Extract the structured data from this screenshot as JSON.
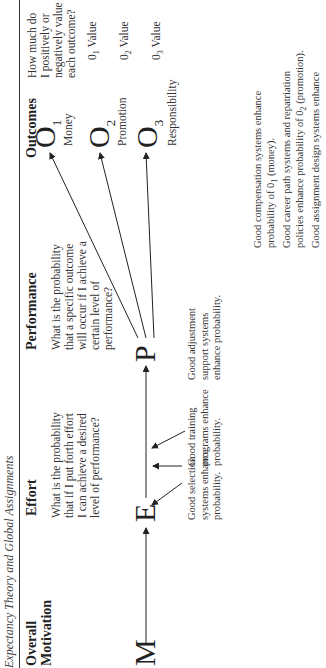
{
  "caption": "Expectancy Theory and Global Assignments",
  "columns": {
    "motivation": "Overall\nMotivation",
    "effort": "Effort",
    "performance": "Performance",
    "outcomes": "Outcomes"
  },
  "questions": {
    "effort": [
      "What is the probability",
      "that if I put forth effort",
      "I can achieve a desired",
      "level of performance?"
    ],
    "performance": [
      "What is the probability",
      "that a specific outcome",
      "will occur if I achieve a",
      "certain level of",
      "performance?"
    ],
    "outcomes": [
      "How much do",
      "I positively or",
      "negatively value",
      "each outcome?"
    ]
  },
  "nodes": {
    "M": "M",
    "E": "E",
    "P": "P",
    "O": "O",
    "o1_sub": "1",
    "o2_sub": "2",
    "o3_sub": "3"
  },
  "outcome_labels": [
    "Money",
    "Promotion",
    "Responsibility"
  ],
  "values": [
    {
      "prefix": "0",
      "sub": "1",
      "label": "Value"
    },
    {
      "prefix": "0",
      "sub": "2",
      "label": "Value"
    },
    {
      "prefix": "0",
      "sub": "3",
      "label": "Value"
    }
  ],
  "notes": {
    "selection": [
      "Good selection",
      "systems enhance",
      "probability."
    ],
    "training": [
      "Good training",
      "programs enhance",
      "probability."
    ],
    "adjustment": [
      "Good adjustment",
      "support systems",
      "enhance probability."
    ],
    "compensation": [
      "Good compensation systems enhance",
      "probability of 0",
      "1",
      " (money)."
    ],
    "career": [
      "Good career path systems and repatriation",
      "policies enhance probability of 0",
      "2",
      " (promotion)."
    ],
    "assignment": [
      "Good assignment design systems enhance"
    ]
  }
}
